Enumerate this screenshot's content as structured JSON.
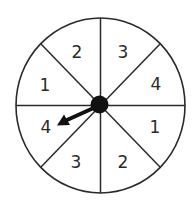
{
  "spinner": {
    "sector_count": 8,
    "sectors": [
      {
        "position": "top-left",
        "label": "2"
      },
      {
        "position": "top-right",
        "label": "3"
      },
      {
        "position": "right-upper",
        "label": "4"
      },
      {
        "position": "right-lower",
        "label": "1"
      },
      {
        "position": "bottom-right",
        "label": "2"
      },
      {
        "position": "bottom-left",
        "label": "3"
      },
      {
        "position": "left-lower",
        "label": "4"
      },
      {
        "position": "left-upper",
        "label": "1"
      }
    ],
    "pointer": {
      "points_to_sector": "left-lower",
      "points_to_label": "4"
    },
    "colors": {
      "outline": "#2a2a2a",
      "hub": "#111111",
      "background": "#ffffff"
    }
  }
}
